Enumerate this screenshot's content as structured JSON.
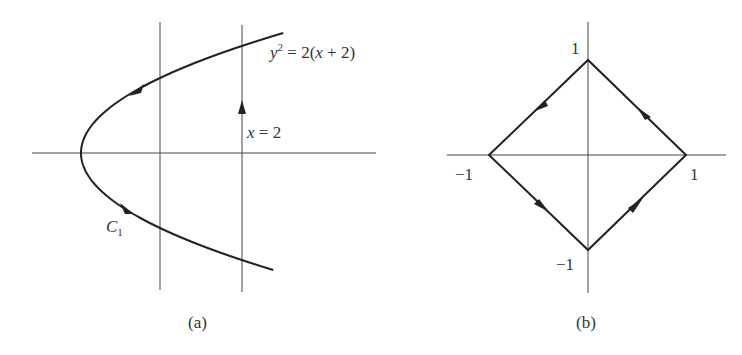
{
  "panels": {
    "a": {
      "caption": "(a)",
      "curve_label_y": "y",
      "curve_label_exp": "2",
      "curve_label_rest": " = 2(",
      "curve_label_x": "x",
      "curve_label_end": " + 2)",
      "line_label_x": "x",
      "line_label_rest": " = 2",
      "contour_label": "C",
      "contour_sub": "1"
    },
    "b": {
      "caption": "(b)",
      "tick_top": "1",
      "tick_left": "−1",
      "tick_right": "1",
      "tick_bottom": "−1"
    }
  },
  "colors": {
    "line": "#222222",
    "axis": "#444444",
    "text": "#333333"
  },
  "chart_data": [
    {
      "type": "line",
      "title": "(a)",
      "curves": [
        {
          "name": "y^2 = 2(x+2)",
          "kind": "parabola",
          "vertex": [
            -2,
            0
          ],
          "orientation": "opens right",
          "direction": "from upper branch through vertex to lower branch"
        },
        {
          "name": "x = 2",
          "kind": "vertical line",
          "direction": "upward"
        }
      ],
      "annotations": [
        "y^2 = 2(x+2)",
        "x = 2",
        "C1"
      ]
    },
    {
      "type": "line",
      "title": "(b)",
      "polygon": [
        [
          1,
          0
        ],
        [
          0,
          1
        ],
        [
          -1,
          0
        ],
        [
          0,
          -1
        ]
      ],
      "direction": "counterclockwise",
      "tick_labels": {
        "x": [
          "-1",
          "1"
        ],
        "y": [
          "-1",
          "1"
        ]
      }
    }
  ]
}
